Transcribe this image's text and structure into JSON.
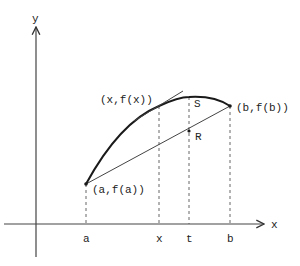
{
  "diagram": {
    "axes": {
      "x_label": "x",
      "y_label": "y"
    },
    "ticks": [
      {
        "id": "a",
        "label": "a"
      },
      {
        "id": "x",
        "label": "x"
      },
      {
        "id": "t",
        "label": "t"
      },
      {
        "id": "b",
        "label": "b"
      }
    ],
    "points": {
      "A": {
        "label": "(a,f(a))"
      },
      "X": {
        "label": "(x,f(x))"
      },
      "B": {
        "label": "(b,f(b))"
      },
      "S": {
        "label": "S"
      },
      "R": {
        "label": "R"
      }
    },
    "elements": {
      "curve": "graph of f from a to b (concave)",
      "chord": "secant line from (a,f(a)) to (b,f(b))",
      "tangent": "tangent line at (x,f(x))"
    },
    "colors": {
      "stroke": "#1a1a1a",
      "background": "#ffffff"
    }
  }
}
